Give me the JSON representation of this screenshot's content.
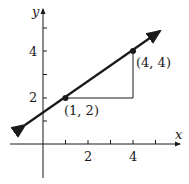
{
  "axes": {
    "x_label": "x",
    "y_label": "y",
    "x_ticks": [
      "2",
      "4"
    ],
    "y_ticks": [
      "2",
      "4"
    ]
  },
  "points": [
    {
      "label": "(1, 2)",
      "x": 1,
      "y": 2
    },
    {
      "label": "(4, 4)",
      "x": 4,
      "y": 4
    }
  ],
  "line": {
    "slope": 0.6667,
    "intercept": 1.3333
  },
  "colors": {
    "ink": "#1a1a1a",
    "background": "#ffffff"
  }
}
